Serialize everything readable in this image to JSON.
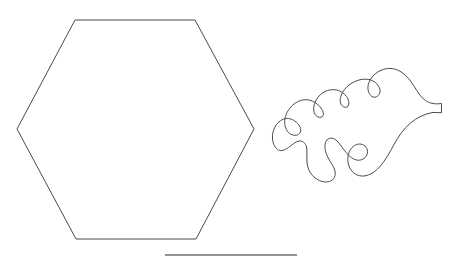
{
  "canvas": {
    "width": 463,
    "height": 262,
    "background_color": "#ffffff",
    "stroke_color": "#4a4a4a",
    "rule_color": "#6e6e6e"
  },
  "shapes": [
    {
      "id": "hexagon",
      "name": "hexagon-outline",
      "type": "polygon",
      "sides": 6,
      "points": "75,20 195,20 254,129 196,239 76,239 17,129",
      "bbox": {
        "x": 17,
        "y": 20,
        "width": 237,
        "height": 219
      },
      "fill": "none",
      "stroke_width": 1
    },
    {
      "id": "leaf",
      "name": "lobed-leaf-outline",
      "type": "path",
      "path": "M 441.5 103.5 L 441.5 112.8 L 433.0 112.4 C 424.5 114.0 417.0 117.5 410.5 123.0 C 404.0 128.5 398.5 136.0 394.0 144.5 C 389.5 153.0 385.0 161.0 379.5 167.0 C 374.0 173.0 367.5 176.5 361.5 176.0 C 355.5 175.5 351.0 171.5 349.0 166.0 C 347.0 160.5 347.5 154.0 350.5 149.5 C 353.5 145.0 358.5 143.0 362.5 144.5 C 366.5 146.0 368.5 150.5 367.0 154.5 C 365.5 158.5 361.0 161.0 356.5 160.0 C 352.0 159.0 348.0 155.0 344.5 150.5 C 341.0 146.0 338.0 141.0 334.5 139.0 C 331.0 137.0 327.0 138.5 325.5 142.5 C 324.0 146.5 325.5 152.5 328.0 157.5 C 330.5 162.5 334.0 166.5 335.0 171.0 C 336.0 175.5 334.0 180.0 329.5 181.5 C 325.0 183.0 318.5 181.0 314.0 177.0 C 309.5 173.0 307.5 167.5 307.0 162.0 C 306.5 156.5 307.5 151.0 306.5 147.0 C 305.5 143.0 302.5 140.5 299.0 141.0 C 295.5 141.5 292.0 145.0 288.5 147.5 C 285.0 150.0 281.5 151.5 278.5 150.0 C 275.5 148.5 273.0 144.0 272.5 139.0 C 272.0 134.0 273.5 128.5 276.5 124.5 C 279.5 120.5 284.0 118.0 288.5 118.5 C 293.0 119.0 297.5 122.5 299.5 126.0 C 301.5 129.5 301.0 133.0 298.5 134.5 C 296.0 136.0 291.5 135.5 288.5 132.5 C 285.5 129.5 284.0 124.0 285.0 118.5 C 286.0 113.0 289.5 107.5 294.0 104.0 C 298.5 100.5 304.0 99.0 309.0 100.0 C 314.0 101.0 318.5 104.5 321.0 108.0 C 323.5 111.5 324.0 115.0 322.5 116.5 C 321.0 118.0 317.5 117.5 315.5 115.0 C 313.5 112.5 313.0 108.0 314.5 103.5 C 316.0 99.0 319.5 94.5 324.0 92.0 C 328.5 89.5 334.0 89.0 338.5 90.5 C 343.0 92.0 346.5 95.5 348.0 99.0 C 349.5 102.5 349.0 106.0 347.0 107.0 C 345.0 108.0 341.5 106.5 340.5 103.0 C 339.5 99.5 341.0 94.0 344.5 89.5 C 348.0 85.0 353.5 81.5 359.0 80.0 C 364.5 78.5 370.0 79.0 374.0 81.5 C 378.0 84.0 380.5 88.5 380.0 92.0 C 379.5 95.5 376.0 98.0 373.0 97.0 C 370.0 96.0 367.5 91.5 368.0 86.5 C 368.5 81.5 372.0 76.0 377.0 72.5 C 382.0 69.0 388.5 67.5 394.5 69.0 C 400.5 70.5 406.0 75.0 410.5 81.0 C 415.0 87.0 418.5 94.5 423.5 99.0 C 428.5 103.5 435.0 104.5 441.5 103.5 Z",
      "bbox": {
        "x": 272,
        "y": 67,
        "width": 170,
        "height": 116
      },
      "fill": "none",
      "stroke_width": 1,
      "description": "oak-leaf-like lobed closed curve with small rectangular stem nub on the right"
    },
    {
      "id": "baseline-rule",
      "name": "horizontal-rule-line",
      "type": "line",
      "x1": 165,
      "y1": 255,
      "x2": 297,
      "y2": 255,
      "stroke_width": 1.4
    }
  ]
}
